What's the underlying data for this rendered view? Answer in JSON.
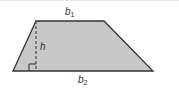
{
  "diagram": {
    "type": "trapezoid",
    "labels": {
      "top_base": {
        "var": "b",
        "sub": "1"
      },
      "bottom_base": {
        "var": "b",
        "sub": "2"
      },
      "height": {
        "var": "h"
      }
    },
    "colors": {
      "fill": "#c8c8c8",
      "stroke": "#333333",
      "height_line": "#555555"
    }
  }
}
